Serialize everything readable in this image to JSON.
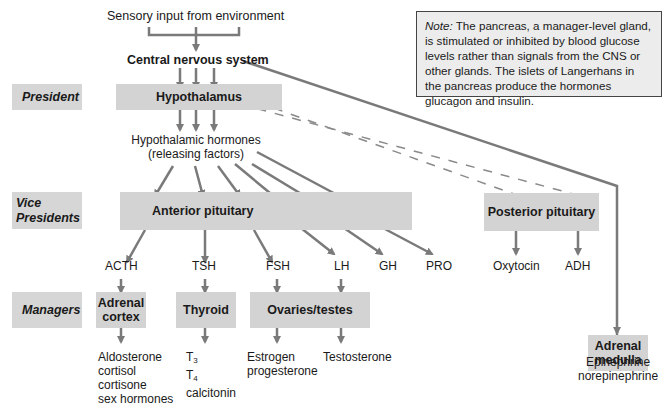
{
  "diagram": {
    "type": "endocrine-hierarchy",
    "input_label": "Sensory input from environment",
    "cns_label": "Central nervous system",
    "ranks": {
      "president": "President",
      "vice_presidents": "Vice Presidents",
      "managers": "Managers"
    },
    "president_box": "Hypothalamus",
    "hypothalamic_hormones": [
      "Hypothalamic hormones",
      "(releasing factors)"
    ],
    "vice_president_boxes": {
      "anterior": "Anterior pituitary",
      "posterior": "Posterior pituitary"
    },
    "anterior_hormones": [
      "ACTH",
      "TSH",
      "FSH",
      "LH",
      "GH",
      "PRO"
    ],
    "posterior_hormones": [
      "Oxytocin",
      "ADH"
    ],
    "manager_boxes": {
      "adrenal_cortex": [
        "Adrenal",
        "cortex"
      ],
      "thyroid": "Thyroid",
      "gonads": "Ovaries/testes",
      "adrenal_medulla": [
        "Adrenal",
        "medulla"
      ]
    },
    "outputs": {
      "adrenal_cortex": [
        "Aldosterone",
        "cortisol",
        "cortisone",
        "sex hormones"
      ],
      "thyroid": {
        "t3": "T",
        "t3_sub": "3",
        "t4": "T",
        "t4_sub": "4",
        "other": "calcitonin"
      },
      "ovaries": [
        "Estrogen",
        "progesterone"
      ],
      "testes": "Testosterone",
      "adrenal_medulla": [
        "Epinephrine",
        "norepinephrine"
      ]
    },
    "note": {
      "prefix": "Note:",
      "text": " The pancreas, a manager-level gland, is stimulated or inhibited by blood glucose levels rather than signals from the CNS or other glands. The islets of Langerhans in the pancreas produce the hormones glucagon and insulin."
    },
    "colors": {
      "box_fill": "#d3d3d3",
      "arrow": "#7a7a7a",
      "note_fill": "#ececec"
    }
  }
}
